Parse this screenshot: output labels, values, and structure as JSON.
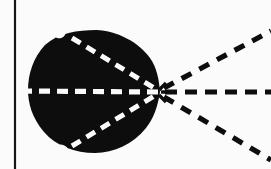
{
  "figure": {
    "title": "",
    "background_color": "#fbfbfb",
    "ink_color": "#0d0d0d",
    "dash_light_color": "#fbfbfb",
    "width": 271,
    "height": 169
  },
  "border": {
    "left_rule": {
      "name": "left-vertical-rule",
      "x": 15,
      "y_start": 0,
      "y_end": 169,
      "stroke_width": 2.2,
      "color": "#151515"
    }
  },
  "blob": {
    "name": "dark-blob",
    "fill": "#0d0d0d",
    "description": "Irregular dark rounded mass with a pointed cusp on the right and two small notches on the upper-left and lower-left rim",
    "bounds": {
      "left": 28,
      "right": 160,
      "top": 30,
      "bottom": 153
    },
    "cusp_point": {
      "x": 160,
      "y": 92
    },
    "path": "M 96 30 C 118 31 138 42 150 58 C 157 68 159 80 160 92 C 158 105 154 118 146 128 C 133 144 114 153 95 153 C 75 153 56 146 44 132 C 32 118 28 103 28 90 C 28 74 33 58 45 45 C 58 33 78 30 96 30 Z",
    "notches": [
      {
        "name": "notch-upper-left",
        "cx": 60,
        "cy": 34,
        "rx": 5.5,
        "ry": 4.2,
        "rotation": -18
      },
      {
        "name": "notch-lower-left",
        "cx": 62,
        "cy": 149,
        "rx": 6.0,
        "ry": 4.2,
        "rotation": 16
      }
    ]
  },
  "lines": [
    {
      "name": "axis-dashed-line-horizontal-inside",
      "label": "horizontal symmetry axis (inside blob)",
      "x1": 21,
      "y1": 91,
      "x2": 160,
      "y2": 92,
      "color": "#fbfbfb",
      "stroke_width": 5.2,
      "dasharray": "11 7"
    },
    {
      "name": "axis-dashed-line-upper-inside",
      "label": "upper diagonal axis (inside blob)",
      "x1": 72,
      "y1": 38,
      "x2": 159,
      "y2": 91,
      "color": "#fbfbfb",
      "stroke_width": 5.0,
      "dasharray": "10 7"
    },
    {
      "name": "axis-dashed-line-lower-inside",
      "label": "lower diagonal axis (inside blob)",
      "x1": 72,
      "y1": 146,
      "x2": 159,
      "y2": 93,
      "color": "#fbfbfb",
      "stroke_width": 5.0,
      "dasharray": "10 7"
    },
    {
      "name": "ray-dashed-horizontal-right",
      "label": "horizontal ray extending right from cusp",
      "x1": 165,
      "y1": 92,
      "x2": 271,
      "y2": 92,
      "color": "#0d0d0d",
      "stroke_width": 5.0,
      "dasharray": "12 8"
    },
    {
      "name": "ray-dashed-upper-right",
      "label": "upper ray extending right from cusp",
      "x1": 164,
      "y1": 88,
      "x2": 271,
      "y2": 31,
      "color": "#0d0d0d",
      "stroke_width": 5.2,
      "dasharray": "11 9"
    },
    {
      "name": "ray-dashed-lower-right",
      "label": "lower ray extending right from cusp",
      "x1": 164,
      "y1": 97,
      "x2": 271,
      "y2": 160,
      "color": "#0d0d0d",
      "stroke_width": 5.2,
      "dasharray": "11 9"
    }
  ],
  "cusp_marks": [
    {
      "name": "cusp-spoke-up",
      "x1": 159,
      "y1": 90,
      "x2": 166,
      "y2": 83
    },
    {
      "name": "cusp-spoke-down",
      "x1": 159,
      "y1": 95,
      "x2": 166,
      "y2": 102
    },
    {
      "name": "cusp-spoke-right",
      "x1": 161,
      "y1": 92,
      "x2": 169,
      "y2": 92
    }
  ]
}
